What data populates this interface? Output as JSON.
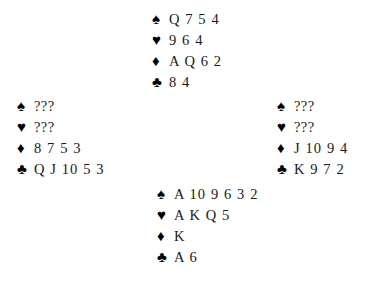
{
  "diagram": {
    "type": "bridge-deal",
    "unknown_marker": "???",
    "suit_symbols": {
      "spade": "♠",
      "heart": "♥",
      "diamond": "♦",
      "club": "♣"
    },
    "colors": {
      "background": "#ffffff",
      "symbol": "#000000",
      "text": "#1a1a1a"
    }
  },
  "hands": {
    "north": {
      "seat": "North",
      "spades": "Q 7 5 4",
      "hearts": "9 6 4",
      "diamonds": "A Q 6 2",
      "clubs": "8 4"
    },
    "west": {
      "seat": "West",
      "spades": "???",
      "hearts": "???",
      "diamonds": "8 7 5 3",
      "clubs": "Q J 10 5 3"
    },
    "east": {
      "seat": "East",
      "spades": "???",
      "hearts": "???",
      "diamonds": "J 10 9 4",
      "clubs": "K 9 7 2"
    },
    "south": {
      "seat": "South",
      "spades": "A 10 9 6 3 2",
      "hearts": "A K Q 5",
      "diamonds": "K",
      "clubs": "A 6"
    }
  }
}
